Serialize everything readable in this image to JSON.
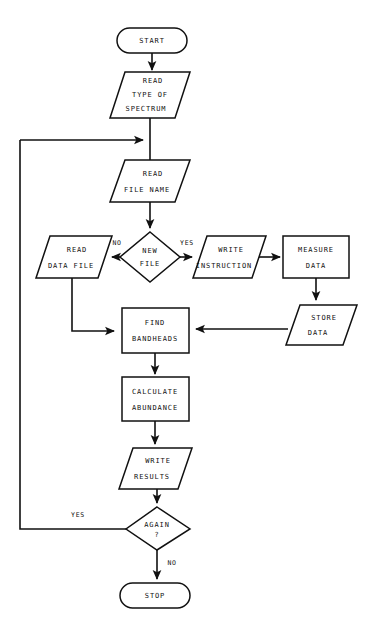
{
  "diagram": {
    "type": "flowchart",
    "canvas": {
      "width": 369,
      "height": 628
    },
    "colors": {
      "background": "#ffffff",
      "stroke": "#111111",
      "fill": "#ffffff",
      "text": "#111111"
    },
    "nodes": [
      {
        "id": "start",
        "shape": "terminator",
        "lines": [
          "START"
        ],
        "cx": 152,
        "cy": 40,
        "w": 70,
        "h": 25
      },
      {
        "id": "read-type-of-spectrum",
        "shape": "parallelogram",
        "lines": [
          "READ",
          "TYPE OF",
          "SPECTRUM"
        ],
        "cx": 150,
        "cy": 95,
        "w": 64,
        "h": 46
      },
      {
        "id": "read-file-name",
        "shape": "parallelogram",
        "lines": [
          "READ",
          "FILE NAME"
        ],
        "cx": 150,
        "cy": 181,
        "w": 64,
        "h": 42
      },
      {
        "id": "new-file",
        "shape": "decision",
        "lines": [
          "NEW",
          "FILE"
        ],
        "cx": 150,
        "cy": 257,
        "w": 58,
        "h": 46
      },
      {
        "id": "read-data-file",
        "shape": "parallelogram",
        "lines": [
          "READ",
          "DATA FILE"
        ],
        "cx": 74,
        "cy": 257,
        "w": 64,
        "h": 42
      },
      {
        "id": "write-instruction",
        "shape": "parallelogram",
        "lines": [
          "WRITE",
          "INSTRUCTION"
        ],
        "cx": 226,
        "cy": 257,
        "w": 62,
        "h": 42
      },
      {
        "id": "measure-data",
        "shape": "rectangle",
        "lines": [
          "MEASURE",
          "DATA"
        ],
        "cx": 316,
        "cy": 257,
        "w": 65,
        "h": 42
      },
      {
        "id": "store-data",
        "shape": "parallelogram",
        "lines": [
          "STORE",
          "DATA"
        ],
        "cx": 321,
        "cy": 325,
        "w": 64,
        "h": 40
      },
      {
        "id": "find-bandheads",
        "shape": "rectangle",
        "lines": [
          "FIND",
          "BANDHEADS"
        ],
        "cx": 155,
        "cy": 330,
        "w": 66,
        "h": 45
      },
      {
        "id": "calculate-abundance",
        "shape": "rectangle",
        "lines": [
          "CALCULATE",
          "ABUNDANCE"
        ],
        "cx": 155,
        "cy": 399,
        "w": 66,
        "h": 43
      },
      {
        "id": "write-results",
        "shape": "parallelogram",
        "lines": [
          "WRITE",
          "RESULTS"
        ],
        "cx": 155,
        "cy": 468,
        "w": 64,
        "h": 41
      },
      {
        "id": "again",
        "shape": "decision",
        "lines": [
          "AGAIN",
          "?"
        ],
        "cx": 159,
        "cy": 528,
        "w": 62,
        "h": 42
      },
      {
        "id": "stop",
        "shape": "terminator",
        "lines": [
          "STOP"
        ],
        "cx": 155,
        "cy": 595,
        "w": 70,
        "h": 25
      }
    ],
    "edge_labels": [
      {
        "id": "no-new-file",
        "text": "NO",
        "x": 117,
        "y": 243
      },
      {
        "id": "yes-new-file",
        "text": "YES",
        "x": 187,
        "y": 243
      },
      {
        "id": "yes-again",
        "text": "YES",
        "x": 78,
        "y": 515
      },
      {
        "id": "no-again",
        "text": "NO",
        "x": 172,
        "y": 563
      }
    ],
    "edges": [
      {
        "id": "start-to-read-type",
        "from": "start",
        "to": "read-type-of-spectrum",
        "arrow": true
      },
      {
        "id": "read-type-to-read-file-name",
        "from": "read-type-of-spectrum",
        "to": "read-file-name",
        "arrow": true
      },
      {
        "id": "read-file-name-to-new-file",
        "from": "read-file-name",
        "to": "new-file",
        "arrow": true
      },
      {
        "id": "new-file-no-to-read-data-file",
        "from": "new-file",
        "to": "read-data-file",
        "arrow": true,
        "label": "NO"
      },
      {
        "id": "new-file-yes-to-write-instruction",
        "from": "new-file",
        "to": "write-instruction",
        "arrow": true,
        "label": "YES"
      },
      {
        "id": "write-instruction-to-measure-data",
        "from": "write-instruction",
        "to": "measure-data",
        "arrow": true
      },
      {
        "id": "measure-data-to-store-data",
        "from": "measure-data",
        "to": "store-data",
        "arrow": true
      },
      {
        "id": "store-data-to-find-bandheads",
        "from": "store-data",
        "to": "find-bandheads",
        "arrow": true
      },
      {
        "id": "read-data-file-to-find-bandheads",
        "from": "read-data-file",
        "to": "find-bandheads",
        "arrow": true
      },
      {
        "id": "find-bandheads-to-calculate-abundance",
        "from": "find-bandheads",
        "to": "calculate-abundance",
        "arrow": true
      },
      {
        "id": "calculate-abundance-to-write-results",
        "from": "calculate-abundance",
        "to": "write-results",
        "arrow": true
      },
      {
        "id": "write-results-to-again",
        "from": "write-results",
        "to": "again",
        "arrow": true
      },
      {
        "id": "again-yes-loop-to-read-file-name",
        "from": "again",
        "to": "read-file-name",
        "arrow": true,
        "label": "YES"
      },
      {
        "id": "again-no-to-stop",
        "from": "again",
        "to": "stop",
        "arrow": true,
        "label": "NO"
      }
    ]
  }
}
